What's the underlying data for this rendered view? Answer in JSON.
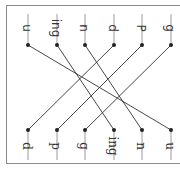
{
  "worksheet": {
    "type": "matching-exercise",
    "orientation": "rotated-90-clockwise",
    "colors": {
      "line": "#333333",
      "stem": "#9a9a9a",
      "dot": "#222222",
      "frame": "#8a8a8a"
    },
    "top_row": {
      "font": "sans",
      "items": [
        {
          "label": "u",
          "x": 28
        },
        {
          "label": "ing",
          "x": 57
        },
        {
          "label": "n",
          "x": 85
        },
        {
          "label": "d",
          "x": 114
        },
        {
          "label": "P",
          "x": 142
        },
        {
          "label": "g",
          "x": 171
        }
      ]
    },
    "bottom_row": {
      "font": "serif",
      "items": [
        {
          "label": "d",
          "x": 28
        },
        {
          "label": "p",
          "x": 57
        },
        {
          "label": "g",
          "x": 85
        },
        {
          "label": "ing",
          "x": 114
        },
        {
          "label": "n",
          "x": 142
        },
        {
          "label": "u",
          "x": 171
        }
      ]
    },
    "connections": [
      {
        "from": 0,
        "to": 5
      },
      {
        "from": 1,
        "to": 3
      },
      {
        "from": 2,
        "to": 4
      },
      {
        "from": 3,
        "to": 0
      },
      {
        "from": 4,
        "to": 1
      },
      {
        "from": 5,
        "to": 2
      }
    ]
  }
}
